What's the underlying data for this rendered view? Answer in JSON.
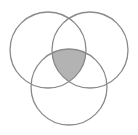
{
  "diagram": {
    "type": "venn",
    "sets": 3,
    "circles": [
      {
        "name": "top-left",
        "cx": 48,
        "cy": 50,
        "r": 38
      },
      {
        "name": "top-right",
        "cx": 90,
        "cy": 50,
        "r": 38
      },
      {
        "name": "bottom",
        "cx": 69,
        "cy": 87,
        "r": 38
      }
    ],
    "shaded_region": "intersection of all three sets",
    "colors": {
      "stroke": "#8a8a8a",
      "shade": "#b3b3b3",
      "background": "#ffffff"
    }
  }
}
